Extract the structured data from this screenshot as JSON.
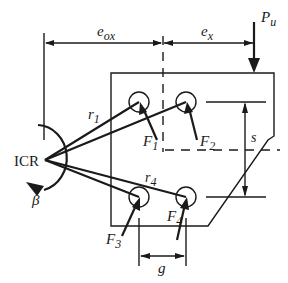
{
  "diagram": {
    "labels": {
      "e_ox_main": "e",
      "e_ox_sub": "ox",
      "e_x_main": "e",
      "e_x_sub": "x",
      "P_main": "P",
      "P_sub": "u",
      "icr": "ICR",
      "beta": "β",
      "r1_main": "r",
      "r1_sub": "1",
      "r4_main": "r",
      "r4_sub": "4",
      "F1_main": "F",
      "F1_sub": "1",
      "F2_main": "F",
      "F2_sub": "2",
      "F3_main": "F",
      "F3_sub": "3",
      "F4_main": "F",
      "F4_sub": "4",
      "s": "s",
      "g": "g"
    },
    "colors": {
      "stroke": "#1a1a1a",
      "background": "#ffffff"
    },
    "bolts": [
      {
        "id": "bolt-1",
        "cx": 139,
        "cy": 102
      },
      {
        "id": "bolt-2",
        "cx": 186,
        "cy": 102
      },
      {
        "id": "bolt-3",
        "cx": 139,
        "cy": 197
      },
      {
        "id": "bolt-4",
        "cx": 186,
        "cy": 197
      }
    ]
  }
}
